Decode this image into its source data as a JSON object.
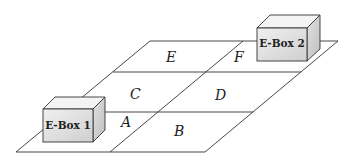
{
  "diagram": {
    "cells": [
      {
        "id": "A",
        "label": "A"
      },
      {
        "id": "B",
        "label": "B"
      },
      {
        "id": "C",
        "label": "C"
      },
      {
        "id": "D",
        "label": "D"
      },
      {
        "id": "E",
        "label": "E"
      },
      {
        "id": "F",
        "label": "F"
      }
    ],
    "boxes": [
      {
        "id": "ebox1",
        "label": "E-Box 1"
      },
      {
        "id": "ebox2",
        "label": "E-Box 2"
      }
    ],
    "colors": {
      "line": "#333333",
      "box_front": "#dcdcdc",
      "box_top": "#f2f2f2",
      "box_side": "#c8c8c8"
    }
  }
}
